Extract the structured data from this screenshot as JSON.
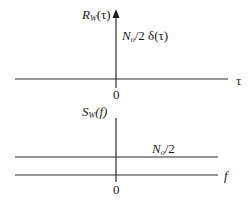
{
  "figure": {
    "top_plot": {
      "y_axis_label_main": "R",
      "y_axis_label_sub": "W",
      "y_axis_label_arg": "(τ)",
      "impulse_label_main": "N",
      "impulse_label_sub": "o",
      "impulse_label_rest": "/2 δ(τ)",
      "x_axis_label": "τ",
      "origin_label": "0"
    },
    "bottom_plot": {
      "y_axis_label_main": "S",
      "y_axis_label_sub": "W",
      "y_axis_label_arg": "(f)",
      "level_label_main": "N",
      "level_label_sub": "o",
      "level_label_rest": "/2",
      "x_axis_label": "f",
      "origin_label": "0"
    },
    "colors": {
      "line": "#2a2a2a",
      "text": "#1a1a1a",
      "background": "#ffffff"
    }
  }
}
